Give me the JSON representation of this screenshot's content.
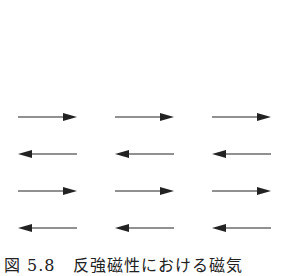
{
  "figure": {
    "rows": [
      {
        "direction": "right"
      },
      {
        "direction": "left"
      },
      {
        "direction": "right"
      },
      {
        "direction": "left"
      }
    ],
    "columns": 3,
    "row_y": [
      117,
      154,
      191,
      228
    ],
    "col_x": [
      [
        18,
        77
      ],
      [
        115,
        174
      ],
      [
        212,
        271
      ]
    ],
    "arrow_color": "#222222",
    "caption": "図 5.8　反強磁性における磁気"
  }
}
